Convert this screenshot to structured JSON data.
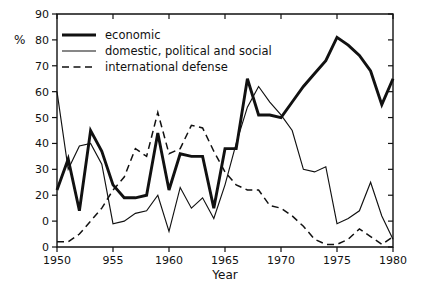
{
  "chart_data": {
    "type": "line",
    "title": "",
    "xlabel": "Year",
    "ylabel": "%",
    "xlim": [
      1950,
      1980
    ],
    "ylim": [
      0,
      90
    ],
    "grid": false,
    "legend_position": "top-left-inside",
    "x_ticks": [
      1950,
      1955,
      1960,
      1965,
      1970,
      1975,
      1980
    ],
    "x_tick_labels": [
      "1950",
      "955",
      "1960",
      "1965",
      "1970",
      "1975",
      "1980"
    ],
    "y_ticks": [
      0,
      10,
      20,
      30,
      40,
      50,
      60,
      70,
      80,
      90
    ],
    "y_tick_labels": [
      "0",
      "0",
      "20",
      "30",
      "40",
      "50",
      "60",
      "70",
      "80",
      "90"
    ],
    "x": [
      1950,
      1951,
      1952,
      1953,
      1954,
      1955,
      1956,
      1957,
      1958,
      1959,
      1960,
      1961,
      1962,
      1963,
      1964,
      1965,
      1966,
      1967,
      1968,
      1969,
      1970,
      1971,
      1972,
      1973,
      1974,
      1975,
      1976,
      1977,
      1978,
      1979,
      1980
    ],
    "series": [
      {
        "name": "economic",
        "style": "thick-solid",
        "color": "#111111",
        "values": [
          22,
          34,
          14,
          45,
          37,
          24,
          19,
          19,
          20,
          44,
          22,
          36,
          35,
          35,
          15,
          38,
          38,
          65,
          51,
          51,
          50,
          56,
          62,
          67,
          72,
          81,
          78,
          74,
          68,
          55,
          65
        ]
      },
      {
        "name": "domestic, political and social",
        "style": "thin-solid",
        "color": "#111111",
        "values": [
          60,
          30,
          39,
          40,
          32,
          9,
          10,
          13,
          14,
          20,
          6,
          23,
          15,
          19,
          11,
          24,
          40,
          54,
          62,
          56,
          51,
          45,
          30,
          29,
          31,
          9,
          11,
          14,
          25,
          12,
          3
        ]
      },
      {
        "name": "international defense",
        "style": "dashed",
        "color": "#111111",
        "values": [
          2,
          2,
          5,
          10,
          15,
          22,
          27,
          38,
          35,
          52,
          36,
          38,
          47,
          46,
          37,
          29,
          24,
          22,
          22,
          16,
          15,
          12,
          8,
          3,
          1,
          1,
          3,
          7,
          4,
          1,
          4
        ]
      }
    ]
  },
  "legend": {
    "items": [
      {
        "label": "economic",
        "style": "thick-solid"
      },
      {
        "label": "domestic, political and social",
        "style": "thin-solid"
      },
      {
        "label": "international defense",
        "style": "dashed"
      }
    ]
  },
  "axes": {
    "x_title": "Year",
    "y_unit": "%"
  }
}
